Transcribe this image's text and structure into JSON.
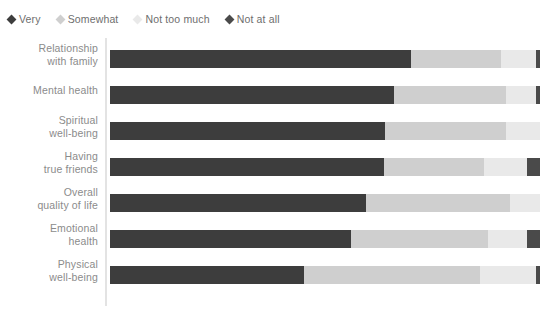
{
  "legend": {
    "position": "top-left",
    "items": [
      {
        "label": "Very",
        "color": "#3d3d3d",
        "marker": "diamond-icon"
      },
      {
        "label": "Somewhat",
        "color": "#cfcfcf",
        "marker": "diamond-icon"
      },
      {
        "label": "Not too much",
        "color": "#e9e9e9",
        "marker": "diamond-icon"
      },
      {
        "label": "Not at all",
        "color": "#4a4a4a",
        "marker": "diamond-icon"
      }
    ]
  },
  "colors": {
    "very": "#3d3d3d",
    "somewhat": "#cfcfcf",
    "not_too_much": "#e9e9e9",
    "not_at_all": "#4a4a4a",
    "axis": "#e3e3e3",
    "label_text": "#8b8b8b",
    "value_text": "#3b3b3b",
    "background": "#ffffff"
  },
  "chart_data": {
    "type": "bar",
    "subtype": "stacked-horizontal-100",
    "title": "",
    "subtitle": "",
    "xlabel": "",
    "ylabel": "",
    "xlim": [
      0,
      100
    ],
    "grid": false,
    "legend_position": "top-left",
    "series": [
      {
        "name": "Very",
        "color": "#3d3d3d",
        "values": [
          70,
          66,
          64,
          63,
          59,
          56,
          45
        ]
      },
      {
        "name": "Somewhat",
        "color": "#cfcfcf",
        "values": [
          21,
          26,
          28,
          23,
          33,
          32,
          41
        ]
      },
      {
        "name": "Not too much",
        "color": "#e9e9e9",
        "values": [
          8,
          7,
          8,
          10,
          7,
          9,
          13
        ]
      },
      {
        "name": "Not at all",
        "color": "#4a4a4a",
        "values": [
          1,
          1,
          0,
          3,
          0,
          3,
          1
        ]
      }
    ],
    "categories": [
      "Relationship with family",
      "Mental health",
      "Spiritual well-being",
      "Having true friends",
      "Overall quality of life",
      "Emotional health",
      "Physical well-being"
    ],
    "rows": [
      {
        "label_line1": "Relationship",
        "label_line2": "with family",
        "segments": [
          {
            "series": "Very",
            "value": 70,
            "label": "70%",
            "color": "#3d3d3d",
            "show_label": true
          },
          {
            "series": "Somewhat",
            "value": 21,
            "label": "21%",
            "color": "#cfcfcf",
            "show_label": true
          },
          {
            "series": "Not too much",
            "value": 8,
            "label": "8%",
            "color": "#e9e9e9",
            "show_label": true
          },
          {
            "series": "Not at all",
            "value": 1,
            "label": "1%",
            "color": "#4a4a4a",
            "show_label": true
          }
        ]
      },
      {
        "label_line1": "Mental health",
        "label_line2": "",
        "segments": [
          {
            "series": "Very",
            "value": 66,
            "label": "66%",
            "color": "#3d3d3d",
            "show_label": true
          },
          {
            "series": "Somewhat",
            "value": 26,
            "label": "26%",
            "color": "#cfcfcf",
            "show_label": true
          },
          {
            "series": "Not too much",
            "value": 7,
            "label": "7%",
            "color": "#e9e9e9",
            "show_label": true
          },
          {
            "series": "Not at all",
            "value": 1,
            "label": "1%",
            "color": "#4a4a4a",
            "show_label": true
          }
        ]
      },
      {
        "label_line1": "Spiritual",
        "label_line2": "well-being",
        "segments": [
          {
            "series": "Very",
            "value": 64,
            "label": "64%",
            "color": "#3d3d3d",
            "show_label": true
          },
          {
            "series": "Somewhat",
            "value": 28,
            "label": "28%",
            "color": "#cfcfcf",
            "show_label": true
          },
          {
            "series": "Not too much",
            "value": 8,
            "label": "8%",
            "color": "#e9e9e9",
            "show_label": true
          },
          {
            "series": "Not at all",
            "value": 0,
            "label": "",
            "color": "#4a4a4a",
            "show_label": false
          }
        ]
      },
      {
        "label_line1": "Having",
        "label_line2": "true friends",
        "segments": [
          {
            "series": "Very",
            "value": 63,
            "label": "63%",
            "color": "#3d3d3d",
            "show_label": true
          },
          {
            "series": "Somewhat",
            "value": 23,
            "label": "23%",
            "color": "#cfcfcf",
            "show_label": true
          },
          {
            "series": "Not too much",
            "value": 10,
            "label": "10%",
            "color": "#e9e9e9",
            "show_label": true
          },
          {
            "series": "Not at all",
            "value": 3,
            "label": "3%",
            "color": "#4a4a4a",
            "show_label": true
          }
        ]
      },
      {
        "label_line1": "Overall",
        "label_line2": "quality of life",
        "segments": [
          {
            "series": "Very",
            "value": 59,
            "label": "59%",
            "color": "#3d3d3d",
            "show_label": true
          },
          {
            "series": "Somewhat",
            "value": 33,
            "label": "33%",
            "color": "#cfcfcf",
            "show_label": true
          },
          {
            "series": "Not too much",
            "value": 7,
            "label": "7%",
            "color": "#e9e9e9",
            "show_label": true
          },
          {
            "series": "Not at all",
            "value": 0,
            "label": "",
            "color": "#4a4a4a",
            "show_label": false
          }
        ]
      },
      {
        "label_line1": "Emotional",
        "label_line2": "health",
        "segments": [
          {
            "series": "Very",
            "value": 56,
            "label": "56%",
            "color": "#3d3d3d",
            "show_label": true
          },
          {
            "series": "Somewhat",
            "value": 32,
            "label": "32%",
            "color": "#cfcfcf",
            "show_label": true
          },
          {
            "series": "Not too much",
            "value": 9,
            "label": "9%",
            "color": "#e9e9e9",
            "show_label": true
          },
          {
            "series": "Not at all",
            "value": 3,
            "label": "3%",
            "color": "#4a4a4a",
            "show_label": true
          }
        ]
      },
      {
        "label_line1": "Physical",
        "label_line2": "well-being",
        "segments": [
          {
            "series": "Very",
            "value": 45,
            "label": "45%",
            "color": "#3d3d3d",
            "show_label": true
          },
          {
            "series": "Somewhat",
            "value": 41,
            "label": "41%",
            "color": "#cfcfcf",
            "show_label": true
          },
          {
            "series": "Not too much",
            "value": 13,
            "label": "13%",
            "color": "#e9e9e9",
            "show_label": true
          },
          {
            "series": "Not at all",
            "value": 1,
            "label": "1%",
            "color": "#4a4a4a",
            "show_label": true
          }
        ]
      }
    ]
  }
}
